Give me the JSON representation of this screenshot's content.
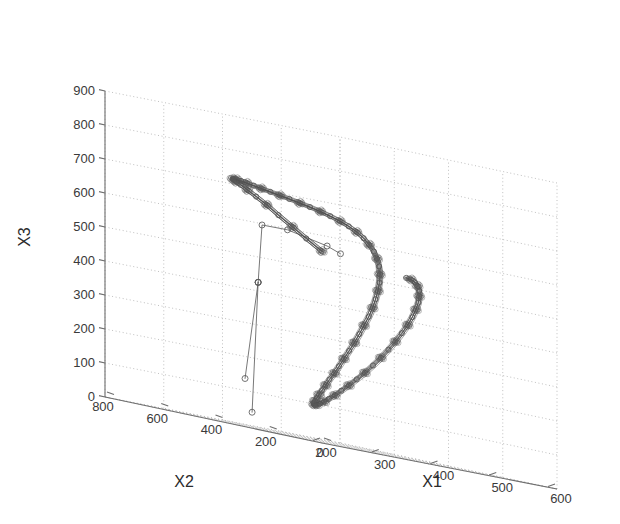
{
  "figure": {
    "background_color": "#ffffff",
    "axis_color": "#6e6e6e",
    "grid_color": "#b9b9b9",
    "data_color": "#4d4d4d",
    "marker_color": "#5a5a5a",
    "text_color": "#3a3a3a"
  },
  "chart_data": {
    "type": "line",
    "title": "",
    "projection": "3d",
    "grid": true,
    "legend": null,
    "xlabel": "X1",
    "ylabel": "X2",
    "zlabel": "X3",
    "xlim": [
      200,
      600
    ],
    "ylim": [
      0,
      800
    ],
    "zlim": [
      0,
      900
    ],
    "xticks": [
      200,
      300,
      400,
      500,
      600
    ],
    "yticks": [
      800,
      600,
      400,
      200,
      0
    ],
    "zticks": [
      0,
      100,
      200,
      300,
      400,
      500,
      600,
      700,
      800,
      900
    ],
    "xtick_labels": [
      "200",
      "300",
      "400",
      "500",
      "600"
    ],
    "ytick_labels": [
      "800",
      "600",
      "400",
      "200",
      "0"
    ],
    "ztick_labels": [
      "0",
      "100",
      "200",
      "300",
      "400",
      "500",
      "600",
      "700",
      "800",
      "900"
    ],
    "marker": "o",
    "marker_size": 5,
    "linewidth": 1,
    "series": [
      {
        "name": "trajectory",
        "points": [
          [
            338,
            300,
            560
          ],
          [
            326,
            331,
            588
          ],
          [
            315,
            358,
            614
          ],
          [
            305,
            388,
            640
          ],
          [
            298,
            416,
            663
          ],
          [
            293,
            444,
            681
          ],
          [
            290,
            470,
            695
          ],
          [
            291,
            497,
            706
          ],
          [
            295,
            522,
            712
          ],
          [
            302,
            548,
            716
          ],
          [
            312,
            572,
            718
          ],
          [
            324,
            594,
            719
          ],
          [
            338,
            614,
            718
          ],
          [
            354,
            632,
            716
          ],
          [
            371,
            648,
            713
          ],
          [
            389,
            661,
            709
          ],
          [
            407,
            672,
            705
          ],
          [
            426,
            680,
            700
          ],
          [
            445,
            686,
            695
          ],
          [
            463,
            690,
            690
          ],
          [
            481,
            691,
            684
          ],
          [
            498,
            690,
            678
          ],
          [
            514,
            686,
            671
          ],
          [
            528,
            680,
            663
          ],
          [
            541,
            672,
            654
          ],
          [
            551,
            662,
            644
          ],
          [
            559,
            650,
            632
          ],
          [
            565,
            637,
            618
          ],
          [
            568,
            623,
            602
          ],
          [
            569,
            608,
            585
          ],
          [
            567,
            592,
            566
          ],
          [
            563,
            576,
            545
          ],
          [
            557,
            560,
            522
          ],
          [
            549,
            544,
            498
          ],
          [
            539,
            528,
            473
          ],
          [
            528,
            513,
            447
          ],
          [
            516,
            498,
            420
          ],
          [
            503,
            484,
            392
          ],
          [
            489,
            471,
            364
          ],
          [
            475,
            458,
            336
          ],
          [
            461,
            446,
            308
          ],
          [
            447,
            435,
            281
          ],
          [
            433,
            424,
            255
          ],
          [
            420,
            414,
            230
          ],
          [
            408,
            405,
            207
          ],
          [
            396,
            397,
            186
          ],
          [
            386,
            389,
            167
          ],
          [
            377,
            383,
            150
          ],
          [
            369,
            377,
            136
          ],
          [
            363,
            372,
            124
          ],
          [
            358,
            368,
            115
          ],
          [
            355,
            365,
            108
          ],
          [
            354,
            363,
            104
          ],
          [
            355,
            362,
            103
          ],
          [
            358,
            362,
            105
          ],
          [
            364,
            363,
            110
          ],
          [
            372,
            365,
            118
          ],
          [
            382,
            369,
            129
          ],
          [
            394,
            373,
            143
          ],
          [
            408,
            379,
            160
          ],
          [
            424,
            386,
            180
          ],
          [
            441,
            394,
            202
          ],
          [
            459,
            403,
            226
          ],
          [
            477,
            412,
            252
          ],
          [
            495,
            422,
            279
          ],
          [
            513,
            433,
            307
          ],
          [
            530,
            444,
            335
          ],
          [
            546,
            455,
            363
          ],
          [
            561,
            466,
            390
          ],
          [
            574,
            477,
            416
          ],
          [
            585,
            488,
            440
          ],
          [
            594,
            498,
            462
          ],
          [
            600,
            508,
            481
          ],
          [
            604,
            517,
            497
          ],
          [
            605,
            525,
            510
          ],
          [
            604,
            532,
            519
          ],
          [
            600,
            538,
            525
          ],
          [
            594,
            543,
            527
          ]
        ]
      },
      {
        "name": "outlier-spur-a",
        "points": [
          [
            300,
            452,
            430
          ],
          [
            262,
            418,
            140
          ]
        ]
      },
      {
        "name": "outlier-spur-b",
        "points": [
          [
            300,
            452,
            430
          ],
          [
            268,
            405,
            45
          ]
        ]
      },
      {
        "name": "interior-chord",
        "points": [
          [
            300,
            452,
            430
          ],
          [
            338,
            520,
            600
          ],
          [
            398,
            556,
            600
          ],
          [
            470,
            566,
            575
          ],
          [
            490,
            560,
            560
          ]
        ]
      }
    ]
  },
  "labels": {
    "x_axis_title": "X1",
    "y_axis_title": "X2",
    "z_axis_title": "X3"
  }
}
